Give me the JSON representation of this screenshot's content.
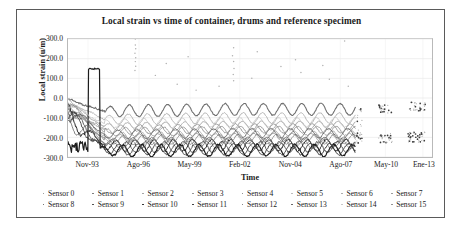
{
  "figure": {
    "title": "Local strain vs time of container, drums and reference specimen"
  },
  "axes": {
    "ylabel": "Local strain (u/m)",
    "xlabel": "Time",
    "yticks": [
      "300.0",
      "200.0",
      "100.0",
      "0.0",
      "-100.0",
      "-200.0",
      "-300.0"
    ],
    "xticks": [
      "Nov-93",
      "Ago-96",
      "May-99",
      "Feb-02",
      "Nov-04",
      "Ago-07",
      "May-10",
      "Ene-13"
    ]
  },
  "legend": {
    "row1": [
      "Sensor 0",
      "Sensor 1",
      "Sensor 2",
      "Sensor 3",
      "Sensor 4",
      "Sensor 5",
      "Sensor 6",
      "Sensor 7"
    ],
    "row2": [
      "Sensor 8",
      "Sensor 9",
      "Sensor 10",
      "Sensor 11",
      "Sensor 12",
      "Sensor 13",
      "Sensor 14",
      "Sensor 15"
    ]
  },
  "chart_data": {
    "type": "line",
    "title": "Local strain vs time of container, drums and reference specimen",
    "xlabel": "Time",
    "ylabel": "Local strain (u/m)",
    "ylim": [
      -300,
      300
    ],
    "ytick_values": [
      300,
      200,
      100,
      0,
      -100,
      -200,
      -300
    ],
    "xtick_labels": [
      "Nov-93",
      "Ago-96",
      "May-99",
      "Feb-02",
      "Nov-04",
      "Ago-07",
      "May-10",
      "Ene-13"
    ],
    "xtick_positions": [
      0.055,
      0.195,
      0.335,
      0.472,
      0.61,
      0.748,
      0.872,
      0.975
    ],
    "grid": true,
    "legend_position": "below-axis",
    "x_range_label": [
      "Nov-93",
      "Ene-13"
    ],
    "data_gap": {
      "from": 0.79,
      "to": 0.845,
      "note": "no continuous data after Ago-07; only sparse clusters"
    },
    "series": [
      {
        "name": "Sensor 0",
        "color": "#7f7f7f",
        "width": 0.7,
        "baseline": -235,
        "amp": 26,
        "phase": 0.0,
        "drift": 4,
        "start_spike": -40,
        "style": "thin"
      },
      {
        "name": "Sensor 1",
        "color": "#6e6e6e",
        "width": 0.7,
        "baseline": -215,
        "amp": 24,
        "phase": 0.35,
        "drift": 6,
        "start_spike": -55,
        "style": "thin"
      },
      {
        "name": "Sensor 2",
        "color": "#9a9a9a",
        "width": 0.8,
        "baseline": -150,
        "amp": 22,
        "phase": 0.15,
        "drift": 10,
        "start_spike": -30,
        "style": "thin"
      },
      {
        "name": "Sensor 3",
        "color": "#8a8a8a",
        "width": 0.8,
        "baseline": -175,
        "amp": 23,
        "phase": 0.25,
        "drift": 8,
        "start_spike": -60,
        "style": "thin"
      },
      {
        "name": "Sensor 4",
        "color": "#707070",
        "width": 1.1,
        "baseline": -70,
        "amp": 30,
        "phase": 0.05,
        "drift": 12,
        "start_spike": -10,
        "style": "band"
      },
      {
        "name": "Sensor 5",
        "color": "#b4b4b4",
        "width": 1.0,
        "baseline": -112,
        "amp": 27,
        "phase": 0.1,
        "drift": 10,
        "start_spike": -25,
        "style": "band"
      },
      {
        "name": "Sensor 6",
        "color": "#a2a2a2",
        "width": 0.8,
        "baseline": -196,
        "amp": 22,
        "phase": 0.45,
        "drift": 6,
        "start_spike": -80,
        "style": "thin"
      },
      {
        "name": "Sensor 7",
        "color": "#8f8f8f",
        "width": 0.8,
        "baseline": -206,
        "amp": 21,
        "phase": 0.55,
        "drift": 5,
        "start_spike": -90,
        "style": "thin"
      },
      {
        "name": "Sensor 8",
        "color": "#4a4a4a",
        "width": 0.9,
        "baseline": -252,
        "amp": 27,
        "phase": 0.2,
        "drift": 3,
        "start_spike": -120,
        "style": "dark"
      },
      {
        "name": "Sensor 9",
        "color": "#3b3b3b",
        "width": 0.9,
        "baseline": -262,
        "amp": 28,
        "phase": 0.6,
        "drift": 2,
        "start_spike": -140,
        "style": "dark"
      },
      {
        "name": "Sensor 10",
        "color": "#1c1c1c",
        "width": 1.2,
        "baseline": -268,
        "amp": 30,
        "phase": 0.4,
        "drift": 2,
        "start_spike": 150,
        "style": "dark"
      },
      {
        "name": "Sensor 11",
        "color": "#2a2a2a",
        "width": 1.0,
        "baseline": -243,
        "amp": 29,
        "phase": 0.75,
        "drift": 3,
        "start_spike": -160,
        "style": "dark"
      },
      {
        "name": "Sensor 12",
        "color": "#616161",
        "width": 0.8,
        "baseline": -228,
        "amp": 25,
        "phase": 0.85,
        "drift": 4,
        "start_spike": -175,
        "style": "thin"
      },
      {
        "name": "Sensor 13",
        "color": "#555555",
        "width": 0.8,
        "baseline": -186,
        "amp": 24,
        "phase": 0.65,
        "drift": 7,
        "start_spike": -70,
        "style": "thin"
      },
      {
        "name": "Sensor 14",
        "color": "#c2c2c2",
        "width": 0.8,
        "baseline": -132,
        "amp": 24,
        "phase": 0.3,
        "drift": 9,
        "start_spike": -45,
        "style": "thin"
      },
      {
        "name": "Sensor 15",
        "color": "#868686",
        "width": 0.8,
        "baseline": -163,
        "amp": 23,
        "phase": 0.5,
        "drift": 8,
        "start_spike": -50,
        "style": "thin"
      }
    ],
    "outliers": [
      {
        "x": 0.185,
        "y": 300
      },
      {
        "x": 0.185,
        "y": 270
      },
      {
        "x": 0.186,
        "y": 250
      },
      {
        "x": 0.184,
        "y": 228
      },
      {
        "x": 0.186,
        "y": 205
      },
      {
        "x": 0.185,
        "y": 185
      },
      {
        "x": 0.186,
        "y": 162
      },
      {
        "x": 0.184,
        "y": 140
      },
      {
        "x": 0.455,
        "y": 255
      },
      {
        "x": 0.452,
        "y": 215
      },
      {
        "x": 0.455,
        "y": 186
      },
      {
        "x": 0.456,
        "y": 150
      },
      {
        "x": 0.454,
        "y": 120
      },
      {
        "x": 0.455,
        "y": 88
      },
      {
        "x": 0.52,
        "y": 235
      },
      {
        "x": 0.3,
        "y": 70
      },
      {
        "x": 0.352,
        "y": 40
      },
      {
        "x": 0.24,
        "y": 115
      },
      {
        "x": 0.625,
        "y": 195
      },
      {
        "x": 0.64,
        "y": 130
      },
      {
        "x": 0.7,
        "y": 165
      },
      {
        "x": 0.718,
        "y": 95
      },
      {
        "x": 0.76,
        "y": 290
      },
      {
        "x": 0.77,
        "y": 60
      },
      {
        "x": 0.585,
        "y": 160
      },
      {
        "x": 0.505,
        "y": 100
      },
      {
        "x": 0.27,
        "y": 175
      },
      {
        "x": 0.33,
        "y": 210
      },
      {
        "x": 0.415,
        "y": 60
      }
    ],
    "sparse_clusters": [
      {
        "x_center": 0.872,
        "y_center": -55,
        "spread_x": 0.02,
        "spread_y": 22,
        "count": 26
      },
      {
        "x_center": 0.872,
        "y_center": -205,
        "spread_x": 0.02,
        "spread_y": 25,
        "count": 30
      },
      {
        "x_center": 0.96,
        "y_center": -45,
        "spread_x": 0.022,
        "spread_y": 24,
        "count": 28
      },
      {
        "x_center": 0.958,
        "y_center": -200,
        "spread_x": 0.024,
        "spread_y": 28,
        "count": 36
      },
      {
        "x_center": 0.8,
        "y_center": -140,
        "spread_x": 0.008,
        "spread_y": 90,
        "count": 30
      }
    ]
  }
}
